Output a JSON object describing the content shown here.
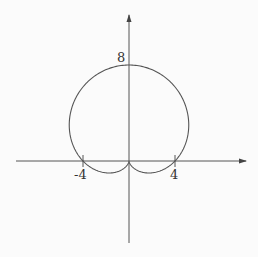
{
  "chart_data": {
    "type": "line",
    "title": "",
    "equation_hint": "polar cardioid r = 4(1 + sin θ)",
    "xlabel": "",
    "ylabel": "",
    "tick_labels": {
      "x": [
        "-4",
        "4"
      ],
      "y": [
        "8"
      ]
    },
    "x_ticks": [
      -4,
      4
    ],
    "y_ticks": [
      8
    ],
    "xlim": [
      -9.7,
      10.3
    ],
    "ylim": [
      -7.0,
      8.3
    ],
    "grid": false,
    "legend": null,
    "series": [
      {
        "name": "curve",
        "kind": "polar",
        "r": "4*(1+sin(theta))",
        "theta_range": [
          0,
          6.2832
        ]
      }
    ],
    "key_points": [
      {
        "x": 0,
        "y": 8,
        "label": "8"
      },
      {
        "x": -4,
        "y": 0,
        "label": "-4"
      },
      {
        "x": 4,
        "y": 0,
        "label": "4"
      },
      {
        "x": 0,
        "y": 0,
        "label": "cusp"
      }
    ],
    "colors": {
      "curve": "#555555",
      "axis": "#555555"
    }
  },
  "labels": {
    "y_top": "8",
    "x_neg": "-4",
    "x_pos": "4"
  }
}
